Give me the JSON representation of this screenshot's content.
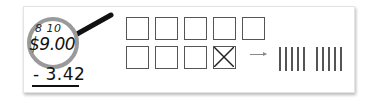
{
  "problem": {
    "regroup_marks": "8 10",
    "minuend": "$9.00",
    "subtrahend": "- 3.42"
  },
  "model": {
    "squares_row1": 5,
    "squares_row2": 4,
    "crossed_square_index": 8,
    "arrow": "→",
    "tally_groups": [
      5,
      5
    ]
  },
  "colors": {
    "ring": "#9a9a9a",
    "handle": "#111111",
    "square_border": "#555555",
    "tally": "#555555"
  }
}
